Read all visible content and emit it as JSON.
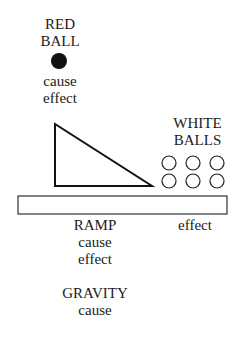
{
  "red_ball": {
    "title_line1": "RED",
    "title_line2": "BALL",
    "role1": "cause",
    "role2": "effect",
    "color": "#111111"
  },
  "white_balls": {
    "title_line1": "WHITE",
    "title_line2": "BALLS",
    "role": "effect",
    "count": 6
  },
  "ramp": {
    "title": "RAMP",
    "role1": "cause",
    "role2": "effect"
  },
  "gravity": {
    "title": "GRAVITY",
    "role": "cause"
  }
}
